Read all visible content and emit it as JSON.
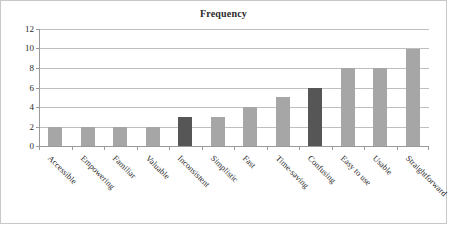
{
  "chart_data": {
    "type": "bar",
    "title": "Frequency",
    "xlabel": "",
    "ylabel": "",
    "ylim": [
      0,
      12
    ],
    "ytick_step": 2,
    "yticks": [
      0,
      2,
      4,
      6,
      8,
      10,
      12
    ],
    "grid": true,
    "legend": false,
    "legend_position": "none",
    "categories": [
      "Accessible",
      "Empowering",
      "Familiar",
      "Valuable",
      "Inconsistent",
      "Simplistic",
      "Fast",
      "Time-saving",
      "Confusing",
      "Easy to use",
      "Usable",
      "Straightforward"
    ],
    "values": [
      2,
      2,
      2,
      2,
      3,
      3,
      4,
      5,
      6,
      8,
      8,
      10
    ],
    "bar_colors": [
      "#a6a6a6",
      "#a6a6a6",
      "#a6a6a6",
      "#a6a6a6",
      "#565656",
      "#a6a6a6",
      "#a6a6a6",
      "#a6a6a6",
      "#565656",
      "#a6a6a6",
      "#a6a6a6",
      "#a6a6a6"
    ],
    "highlight_color": "#565656",
    "default_color": "#a6a6a6",
    "axis_color": "#9a9a9a",
    "grid_color": "#bfbfbf",
    "border_color": "#c8c8c8",
    "text_color": "#2b2b2b"
  }
}
